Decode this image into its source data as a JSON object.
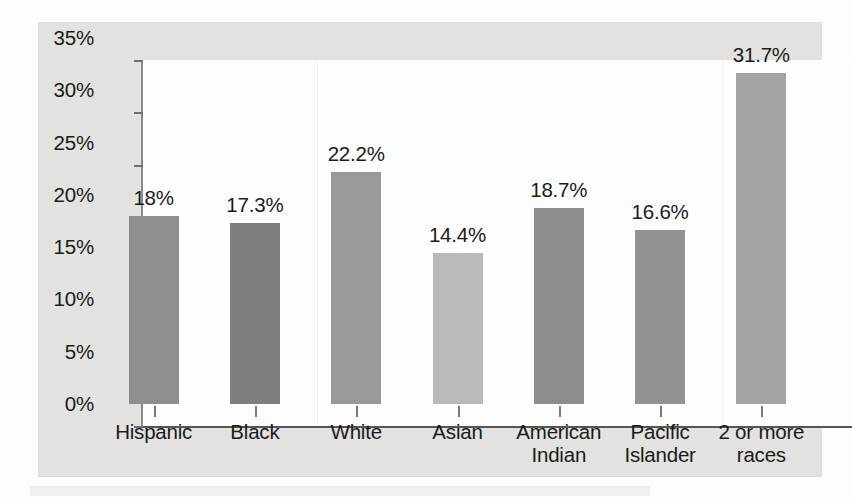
{
  "chart_data": {
    "type": "bar",
    "title": "",
    "subtitle": "",
    "xlabel": "",
    "ylabel": "",
    "categories": [
      "Hispanic",
      "Black",
      "White",
      "Asian",
      "American Indian",
      "Pacific Islander",
      "2 or more races"
    ],
    "category_lines": [
      [
        "Hispanic"
      ],
      [
        "Black"
      ],
      [
        "White"
      ],
      [
        "Asian"
      ],
      [
        "American",
        "Indian"
      ],
      [
        "Pacific",
        "Islander"
      ],
      [
        "2 or more",
        "races"
      ]
    ],
    "values": [
      18,
      17.3,
      22.2,
      14.4,
      18.7,
      16.6,
      31.7
    ],
    "value_labels": [
      "18%",
      "17.3%",
      "22.2%",
      "14.4%",
      "18.7%",
      "16.6%",
      "31.7%"
    ],
    "bar_colors": [
      "#8f8f8f",
      "#7e7e7e",
      "#9a9a9a",
      "#b9b9b9",
      "#8d8d8d",
      "#939393",
      "#a3a3a3"
    ],
    "ylim": [
      0,
      35
    ],
    "ytick_values": [
      0,
      5,
      10,
      15,
      20,
      25,
      30,
      35
    ],
    "ytick_labels": [
      "0%",
      "5%",
      "10%",
      "15%",
      "20%",
      "25%",
      "30%",
      "35%"
    ],
    "grid": false,
    "legend": null,
    "legend_position": "none",
    "axis_color": "#6f6f6f",
    "panel_background": "#e2e2e0",
    "plot_background": "#fdfdfd"
  }
}
